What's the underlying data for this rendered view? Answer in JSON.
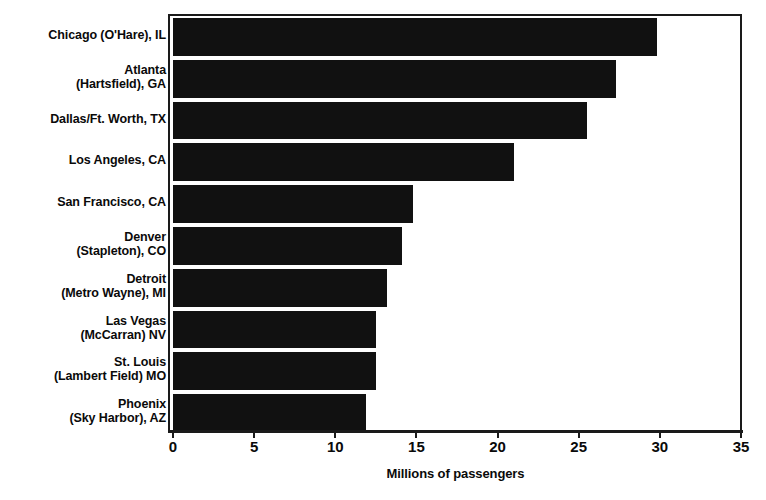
{
  "chart_data": {
    "type": "bar",
    "orientation": "horizontal",
    "title": "",
    "subtitle": "",
    "xlabel": "Millions of passengers",
    "ylabel": "",
    "xlim": [
      0,
      35
    ],
    "xticks": [
      0,
      5,
      10,
      15,
      20,
      25,
      30,
      35
    ],
    "xtick_labels": [
      "0",
      "5",
      "10",
      "15",
      "20",
      "25",
      "30",
      "35"
    ],
    "grid": false,
    "legend": null,
    "bar_color": "#111111",
    "axis_color": "#1a1a1a",
    "categories": [
      "Chicago (O'Hare), IL",
      "Atlanta\n(Hartsfield), GA",
      "Dallas/Ft. Worth, TX",
      "Los Angeles, CA",
      "San Francisco, CA",
      "Denver\n(Stapleton), CO",
      "Detroit\n(Metro Wayne), MI",
      "Las Vegas\n(McCarran) NV",
      "St. Louis\n(Lambert Field) MO",
      "Phoenix\n(Sky Harbor), AZ"
    ],
    "values": [
      29.8,
      27.3,
      25.5,
      21.0,
      14.8,
      14.1,
      13.2,
      12.5,
      12.5,
      11.9
    ],
    "annotations": []
  }
}
